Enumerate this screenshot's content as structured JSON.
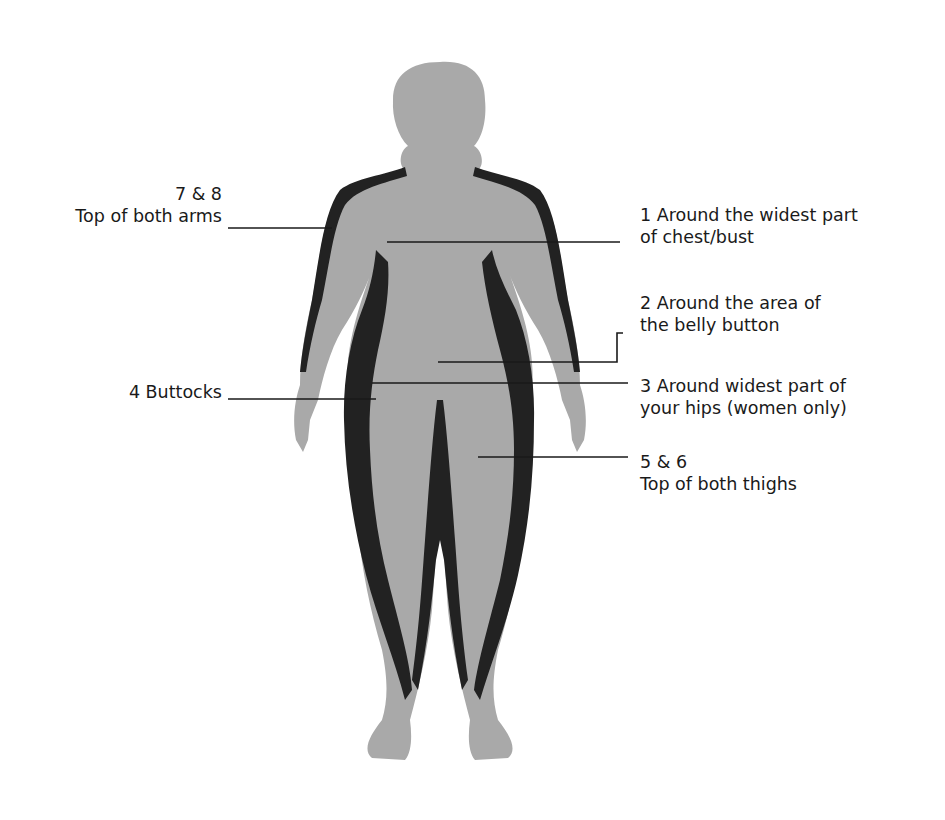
{
  "diagram": {
    "colors": {
      "body_fill": "#a9a9a9",
      "fat_band": "#222222",
      "leader_line": "#1a1a1a",
      "text": "#1a1a1a",
      "background": "#ffffff"
    },
    "labels": [
      {
        "id": "7-8",
        "line1": "7 & 8",
        "line2": "Top of both arms"
      },
      {
        "id": "1",
        "line1": "1  Around the widest part",
        "line2": "of chest/bust"
      },
      {
        "id": "2",
        "line1": "2  Around the area of",
        "line2": "the belly button"
      },
      {
        "id": "4",
        "line1": "4  Buttocks",
        "line2": ""
      },
      {
        "id": "3",
        "line1": "3  Around widest part of",
        "line2": "your hips (women only)"
      },
      {
        "id": "5-6",
        "line1": "5 & 6",
        "line2": "Top of both thighs"
      }
    ]
  }
}
